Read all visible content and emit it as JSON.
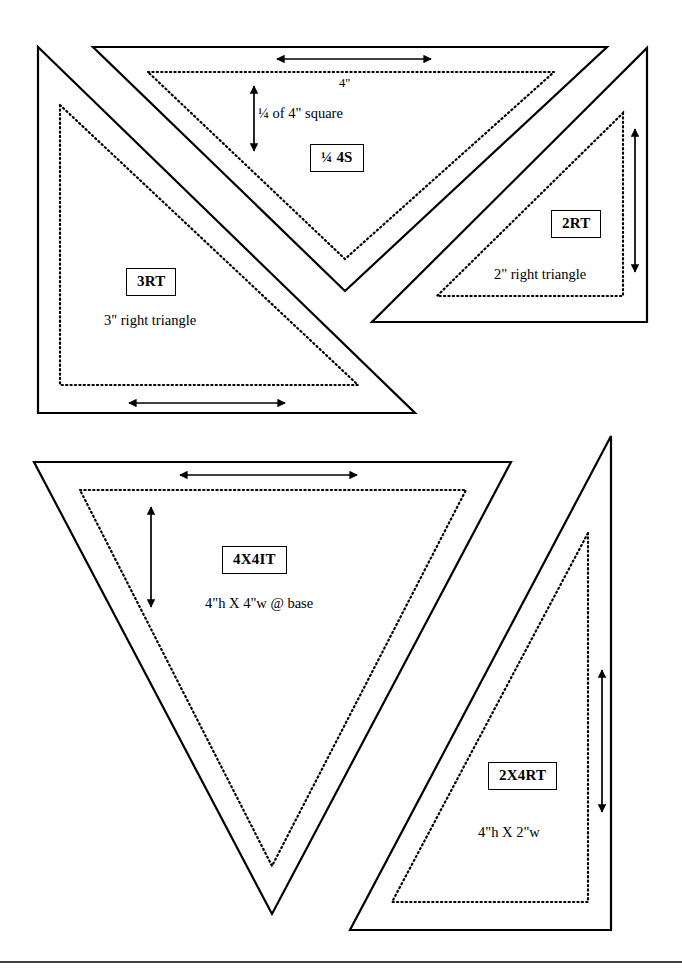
{
  "document": {
    "title": "Quilt template shapes reference sheet",
    "background_color": "#ffffff",
    "line_color": "#000000",
    "page_width": 682,
    "page_height": 972
  },
  "templates": [
    {
      "id": "quarter-4s",
      "code": "¼ 4S",
      "description": "¼ of 4\" square",
      "dimension_label": "4\"",
      "shape": "downward isosceles triangle",
      "position": "top center"
    },
    {
      "id": "3rt",
      "code": "3RT",
      "description": "3\" right triangle",
      "shape": "right triangle",
      "position": "top left"
    },
    {
      "id": "2rt",
      "code": "2RT",
      "description": "2\" right triangle",
      "shape": "right triangle",
      "position": "top right"
    },
    {
      "id": "4x4it",
      "code": "4X4IT",
      "description": "4\"h X 4\"w @ base",
      "shape": "downward isosceles triangle",
      "position": "bottom left"
    },
    {
      "id": "2x4rt",
      "code": "2X4RT",
      "description": "4\"h X 2\"w",
      "shape": "right triangle",
      "position": "bottom right"
    }
  ]
}
